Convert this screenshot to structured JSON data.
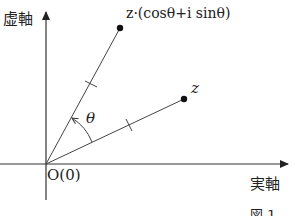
{
  "diagram": {
    "axes": {
      "imaginary_label": "虚軸",
      "real_label": "実軸",
      "origin_label": "O(0)"
    },
    "points": {
      "z_label": "z",
      "rotated_label": "z·(cosθ+i sinθ)"
    },
    "angle_label": "θ",
    "figure_caption": "図 1",
    "colors": {
      "line": "#333333",
      "point": "#111111",
      "text": "#222222"
    }
  }
}
